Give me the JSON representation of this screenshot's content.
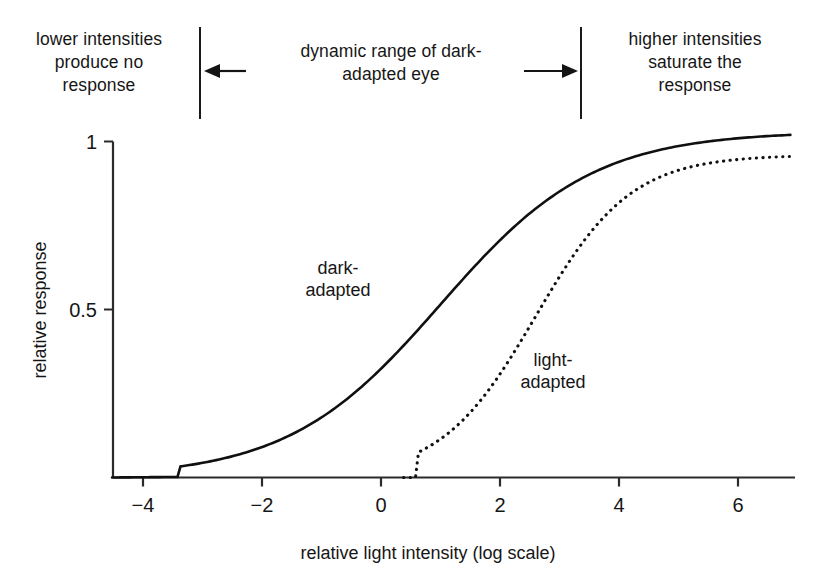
{
  "annotations": {
    "left": "lower intensities produce no response",
    "left_lines": [
      "lower intensities",
      "produce no",
      "response"
    ],
    "middle": "dynamic range of dark-adapted eye",
    "middle_lines": [
      "dynamic range of dark-",
      "adapted eye"
    ],
    "right": "higher intensities saturate the response",
    "right_lines": [
      "higher intensities",
      "saturate the",
      "response"
    ],
    "arrow_left": "left-arrow",
    "arrow_right": "right-arrow"
  },
  "chart_data": {
    "type": "line",
    "title": "",
    "xlabel": "relative light intensity (log scale)",
    "ylabel": "relative response",
    "xlim": [
      -4.5,
      6.9
    ],
    "ylim": [
      0,
      1.06
    ],
    "xticks": [
      -4,
      -2,
      0,
      2,
      4,
      6
    ],
    "xtick_labels": [
      "−4",
      "−2",
      "0",
      "2",
      "4",
      "6"
    ],
    "yticks": [
      0.5,
      1
    ],
    "ytick_labels": [
      "0.5",
      "1"
    ],
    "grid": false,
    "legend_position": "inline-annotations",
    "series": [
      {
        "name": "dark-adapted",
        "style": "solid",
        "label": "dark-adapted",
        "label_lines": [
          "dark-",
          "adapted"
        ],
        "midpoint_x": 1.0,
        "slope": 0.78,
        "plateau": 1.03,
        "onset_x": -3.4,
        "saturation_x": 3.1,
        "x": [
          -4.5,
          -4.0,
          -3.5,
          -3.0,
          -2.5,
          -2.0,
          -1.5,
          -1.0,
          -0.5,
          0.0,
          0.5,
          1.0,
          1.5,
          2.0,
          2.5,
          3.0,
          3.5,
          4.0,
          4.5,
          5.0,
          5.5,
          6.0,
          6.5,
          6.9
        ],
        "y": [
          0.0,
          0.0,
          0.01,
          0.02,
          0.03,
          0.05,
          0.08,
          0.13,
          0.21,
          0.32,
          0.44,
          0.57,
          0.7,
          0.82,
          0.92,
          0.98,
          1.01,
          1.02,
          1.03,
          1.03,
          1.03,
          1.03,
          1.03,
          1.03
        ]
      },
      {
        "name": "light-adapted",
        "style": "dotted",
        "label": "light-adapted",
        "label_lines": [
          "light-",
          "adapted"
        ],
        "midpoint_x": 2.6,
        "slope": 1.25,
        "plateau": 0.96,
        "onset_x": 0.6,
        "saturation_x": 4.2,
        "x": [
          0.4,
          0.8,
          1.2,
          1.6,
          2.0,
          2.4,
          2.8,
          3.2,
          3.6,
          4.0,
          4.4,
          4.8,
          5.2,
          5.6,
          6.0,
          6.4,
          6.9
        ],
        "y": [
          0.0,
          0.02,
          0.05,
          0.12,
          0.25,
          0.43,
          0.61,
          0.76,
          0.86,
          0.91,
          0.93,
          0.94,
          0.945,
          0.95,
          0.955,
          0.957,
          0.96
        ]
      }
    ]
  }
}
